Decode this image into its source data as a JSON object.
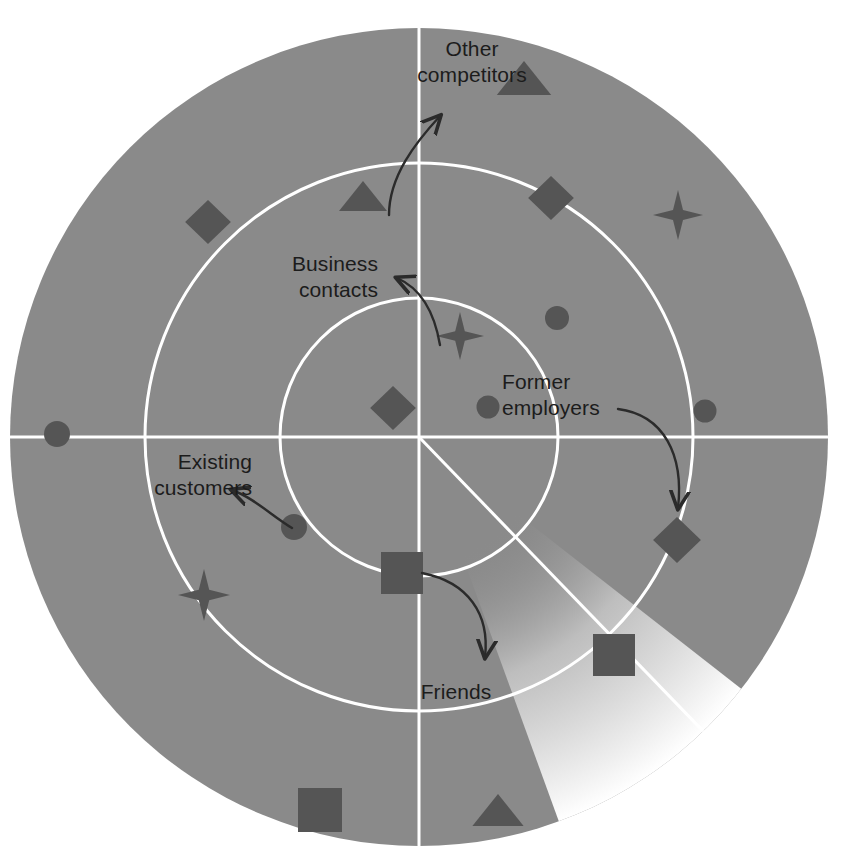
{
  "figure": {
    "width": 846,
    "height": 864,
    "background_color": "#ffffff"
  },
  "colors": {
    "radar_field": "#8a8a8a",
    "sweep_highlight": "#f2f2f2",
    "ring_line": "#ffffff",
    "axis_line": "#ffffff",
    "marker_fill": "#555555",
    "label_text": "#1c1c1c",
    "arrow_stroke": "#2b2b2b"
  },
  "geometry": {
    "center_x": 419,
    "center_y": 437,
    "outer_radius": 409,
    "middle_radius": 274,
    "inner_radius": 139,
    "sweep_start_angle_deg": 38,
    "sweep_end_angle_deg": 70
  },
  "labels": [
    {
      "id": "other-competitors",
      "text": "Other\ncompetitors",
      "x": 372,
      "y": 36,
      "width": 200,
      "align": "center"
    },
    {
      "id": "business-contacts",
      "text": "Business\ncontacts",
      "x": 178,
      "y": 251,
      "width": 200,
      "align": "right"
    },
    {
      "id": "former-employers",
      "text": "Former\nemployers",
      "x": 502,
      "y": 369,
      "width": 200,
      "align": "left"
    },
    {
      "id": "existing-customers",
      "text": "Existing\ncustomers",
      "x": 52,
      "y": 449,
      "width": 200,
      "align": "right"
    },
    {
      "id": "friends",
      "text": "Friends",
      "x": 396,
      "y": 679,
      "width": 120,
      "align": "center"
    }
  ],
  "arrows": [
    {
      "id": "arrow-other-competitors",
      "from_label": "other-competitors",
      "path": "M 389 215 C 389 176 416 142 440 116",
      "head_angle_deg": -48
    },
    {
      "id": "arrow-business-contacts",
      "from_label": "business-contacts",
      "path": "M 440 345 C 434 310 420 288 397 278",
      "head_angle_deg": -160
    },
    {
      "id": "arrow-former-employers",
      "from_label": "former-employers",
      "path": "M 618 409 C 664 415 684 455 678 508",
      "head_angle_deg": 95
    },
    {
      "id": "arrow-existing-customers",
      "from_label": "existing-customers",
      "path": "M 292 528 C 272 516 254 498 232 490",
      "head_angle_deg": -162
    },
    {
      "id": "arrow-friends",
      "from_label": "friends",
      "path": "M 422 573 C 468 582 490 614 485 657",
      "head_angle_deg": 97
    }
  ],
  "markers": [
    {
      "id": "m01",
      "shape": "triangle",
      "x": 524,
      "y": 78,
      "size": 34,
      "ring": "outer"
    },
    {
      "id": "m02",
      "shape": "triangle",
      "x": 363,
      "y": 196,
      "size": 30,
      "ring": "middle"
    },
    {
      "id": "m03",
      "shape": "diamond",
      "x": 208,
      "y": 222,
      "size": 44,
      "ring": "outer"
    },
    {
      "id": "m04",
      "shape": "diamond",
      "x": 551,
      "y": 198,
      "size": 44,
      "ring": "middle"
    },
    {
      "id": "m05",
      "shape": "star",
      "x": 678,
      "y": 215,
      "size": 50,
      "ring": "outer"
    },
    {
      "id": "m06",
      "shape": "circle",
      "x": 557,
      "y": 318,
      "size": 24,
      "ring": "middle"
    },
    {
      "id": "m07",
      "shape": "star",
      "x": 460,
      "y": 336,
      "size": 48,
      "ring": "inner"
    },
    {
      "id": "m08",
      "shape": "diamond",
      "x": 393,
      "y": 408,
      "size": 44,
      "ring": "inner"
    },
    {
      "id": "m09",
      "shape": "circle",
      "x": 488,
      "y": 407,
      "size": 23,
      "ring": "inner"
    },
    {
      "id": "m10",
      "shape": "circle",
      "x": 705,
      "y": 411,
      "size": 23,
      "ring": "outer"
    },
    {
      "id": "m11",
      "shape": "circle",
      "x": 57,
      "y": 434,
      "size": 26,
      "ring": "outer"
    },
    {
      "id": "m12",
      "shape": "circle",
      "x": 294,
      "y": 527,
      "size": 26,
      "ring": "middle"
    },
    {
      "id": "m13",
      "shape": "diamond",
      "x": 677,
      "y": 540,
      "size": 46,
      "ring": "middle"
    },
    {
      "id": "m14",
      "shape": "square",
      "x": 402,
      "y": 573,
      "size": 42,
      "ring": "inner"
    },
    {
      "id": "m15",
      "shape": "star",
      "x": 204,
      "y": 595,
      "size": 52,
      "ring": "middle"
    },
    {
      "id": "m16",
      "shape": "square",
      "x": 614,
      "y": 655,
      "size": 42,
      "ring": "middle"
    },
    {
      "id": "m17",
      "shape": "square",
      "x": 320,
      "y": 810,
      "size": 44,
      "ring": "outer"
    },
    {
      "id": "m18",
      "shape": "triangle",
      "x": 498,
      "y": 810,
      "size": 32,
      "ring": "outer"
    }
  ]
}
